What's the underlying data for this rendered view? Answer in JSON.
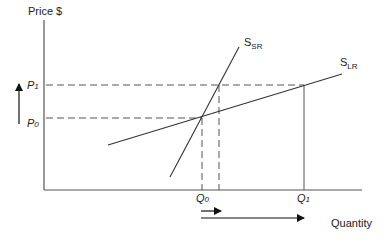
{
  "diagram": {
    "type": "supply-shift-short-run-vs-long-run",
    "y_axis_label": "Price $",
    "x_axis_label": "Quantity",
    "price_levels": [
      {
        "id": "P0",
        "main": "P",
        "sub": "0"
      },
      {
        "id": "P1",
        "main": "P",
        "sub": "1"
      }
    ],
    "quantity_levels": [
      {
        "id": "Q0",
        "main": "Q",
        "sub": "0"
      },
      {
        "id": "Q1",
        "main": "Q",
        "sub": "1"
      }
    ],
    "curves": [
      {
        "id": "SSR",
        "main": "S",
        "sub": "SR",
        "description": "Short-run supply (steep)"
      },
      {
        "id": "SLR",
        "main": "S",
        "sub": "LR",
        "description": "Long-run supply (flat)"
      }
    ],
    "arrows": [
      {
        "id": "price-increase",
        "direction": "up",
        "from": "P0",
        "to": "P1"
      },
      {
        "id": "short-run-quantity-increase",
        "direction": "right",
        "length": "short"
      },
      {
        "id": "long-run-quantity-increase",
        "direction": "right",
        "from": "Q0",
        "to": "Q1"
      }
    ],
    "colors": {
      "line": "#333333",
      "dashed": "#555555",
      "background": "#ffffff"
    }
  }
}
